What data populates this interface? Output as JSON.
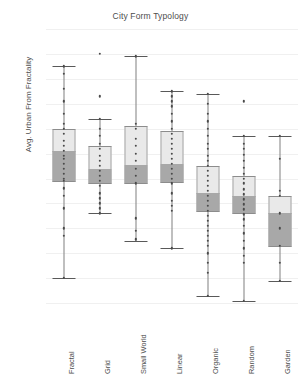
{
  "chart_data": {
    "type": "box",
    "title": "City Form Typology",
    "xlabel": "",
    "ylabel": "Avg. Urban From Fractality",
    "ylim": [
      0.25,
      0.8
    ],
    "ytick_labels": [
      "0,80",
      "0,75",
      "0,70",
      "0,65",
      "0,60",
      "0,55",
      "0,50",
      "0,45",
      "0,40",
      "0,35",
      "0,30",
      "0,25"
    ],
    "ytick_values": [
      0.8,
      0.75,
      0.7,
      0.65,
      0.6,
      0.55,
      0.5,
      0.45,
      0.4,
      0.35,
      0.3,
      0.25
    ],
    "grid": true,
    "legend": "none",
    "decimal_separator": ",",
    "categories": [
      "Fractal",
      "Grid",
      "Small World",
      "Linear",
      "Organic",
      "Random",
      "Garden"
    ],
    "boxes": [
      {
        "category": "Fractal",
        "whisker_low": 0.3,
        "q1": 0.495,
        "median": 0.555,
        "q3": 0.6,
        "whisker_high": 0.725,
        "outliers": [],
        "points": [
          0.725,
          0.71,
          0.68,
          0.655,
          0.63,
          0.61,
          0.6,
          0.59,
          0.575,
          0.565,
          0.555,
          0.545,
          0.54,
          0.53,
          0.52,
          0.51,
          0.5,
          0.495,
          0.48,
          0.465,
          0.44,
          0.4,
          0.385,
          0.3
        ]
      },
      {
        "category": "Grid",
        "whisker_low": 0.43,
        "q1": 0.49,
        "median": 0.52,
        "q3": 0.565,
        "whisker_high": 0.62,
        "outliers": [
          0.75,
          0.665
        ],
        "points": [
          0.62,
          0.6,
          0.585,
          0.57,
          0.56,
          0.545,
          0.535,
          0.525,
          0.515,
          0.505,
          0.495,
          0.485,
          0.47,
          0.46,
          0.45,
          0.44,
          0.43
        ]
      },
      {
        "category": "Small World",
        "whisker_low": 0.375,
        "q1": 0.49,
        "median": 0.528,
        "q3": 0.605,
        "whisker_high": 0.745,
        "outliers": [],
        "points": [
          0.745,
          0.61,
          0.6,
          0.58,
          0.565,
          0.55,
          0.535,
          0.52,
          0.505,
          0.49,
          0.42,
          0.395,
          0.378
        ]
      },
      {
        "category": "Linear",
        "whisker_low": 0.36,
        "q1": 0.492,
        "median": 0.53,
        "q3": 0.595,
        "whisker_high": 0.675,
        "outliers": [],
        "points": [
          0.675,
          0.665,
          0.655,
          0.645,
          0.63,
          0.615,
          0.6,
          0.59,
          0.58,
          0.57,
          0.56,
          0.55,
          0.54,
          0.53,
          0.52,
          0.51,
          0.5,
          0.49,
          0.47,
          0.455,
          0.445,
          0.435,
          0.36
        ]
      },
      {
        "category": "Organic",
        "whisker_low": 0.265,
        "q1": 0.435,
        "median": 0.47,
        "q3": 0.525,
        "whisker_high": 0.67,
        "outliers": [],
        "points": [
          0.67,
          0.65,
          0.63,
          0.615,
          0.6,
          0.585,
          0.57,
          0.56,
          0.545,
          0.535,
          0.525,
          0.515,
          0.505,
          0.495,
          0.485,
          0.475,
          0.465,
          0.455,
          0.445,
          0.435,
          0.425,
          0.415,
          0.405,
          0.395,
          0.385,
          0.375,
          0.365,
          0.35,
          0.33,
          0.31,
          0.265
        ]
      },
      {
        "category": "Random",
        "whisker_low": 0.255,
        "q1": 0.43,
        "median": 0.465,
        "q3": 0.505,
        "whisker_high": 0.585,
        "outliers": [
          0.655
        ],
        "points": [
          0.585,
          0.57,
          0.56,
          0.548,
          0.535,
          0.522,
          0.51,
          0.5,
          0.49,
          0.478,
          0.468,
          0.458,
          0.448,
          0.438,
          0.428,
          0.418,
          0.405,
          0.39,
          0.375,
          0.36,
          0.345,
          0.33,
          0.255
        ]
      },
      {
        "category": "Garden",
        "whisker_low": 0.295,
        "q1": 0.365,
        "median": 0.43,
        "q3": 0.465,
        "whisker_high": 0.585,
        "outliers": [],
        "points": [
          0.585,
          0.54,
          0.475,
          0.465,
          0.43,
          0.4,
          0.365,
          0.33,
          0.295
        ]
      }
    ]
  }
}
